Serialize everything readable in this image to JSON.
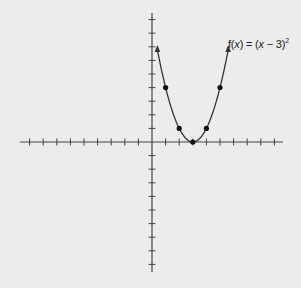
{
  "chart_data": {
    "type": "line",
    "title": "",
    "function_label": "f(x) = (x − 3)²",
    "function_label_parts": {
      "pre": "f(",
      "var": "x",
      "mid": ") = (",
      "var2": "x",
      "post": " − 3)",
      "exp": "2"
    },
    "xlabel": "",
    "ylabel": "",
    "xlim": [
      -10,
      10
    ],
    "ylim": [
      -10,
      10
    ],
    "x_ticks": [
      -9,
      -8,
      -7,
      -6,
      -5,
      -4,
      -3,
      -2,
      -1,
      1,
      2,
      3,
      4,
      5,
      6,
      7,
      8,
      9
    ],
    "y_ticks": [
      -9,
      -8,
      -7,
      -6,
      -5,
      -4,
      -3,
      -2,
      -1,
      1,
      2,
      3,
      4,
      5,
      6,
      7,
      8,
      9
    ],
    "grid": false,
    "series": [
      {
        "name": "f(x) = (x - 3)^2",
        "type": "curve",
        "x_range": [
          0.4,
          5.6
        ]
      },
      {
        "name": "plotted points",
        "type": "scatter",
        "x": [
          1,
          2,
          3,
          4,
          5
        ],
        "y": [
          4,
          1,
          0,
          1,
          4
        ]
      }
    ],
    "arrows_at_ends": true
  },
  "style": {
    "axis_color": "#444444",
    "curve_color": "#333333",
    "point_color": "#111111",
    "background": "#ececec"
  }
}
